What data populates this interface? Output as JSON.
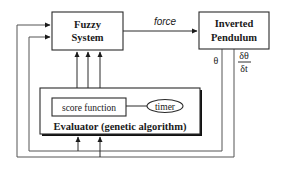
{
  "diagram": {
    "nodes": {
      "fuzzy_system": {
        "line1": "Fuzzy",
        "line2": "System"
      },
      "inverted_pendulum": {
        "line1": "Inverted",
        "line2": "Pendulum"
      },
      "evaluator": {
        "label": "Evaluator (genetic algorithm)"
      },
      "score_function": {
        "label": "score function"
      },
      "timer": {
        "label": "timer"
      }
    },
    "edges": {
      "force": {
        "label": "force",
        "from": "fuzzy_system",
        "to": "inverted_pendulum"
      },
      "theta": {
        "label": "θ",
        "from": "inverted_pendulum",
        "to": [
          "fuzzy_system",
          "evaluator"
        ]
      },
      "dtheta_dt": {
        "numerator": "δθ",
        "denominator": "δt",
        "from": "inverted_pendulum",
        "to": [
          "fuzzy_system",
          "evaluator"
        ]
      },
      "evaluator_to_fuzzy": {
        "count": 3,
        "from": "evaluator",
        "to": "fuzzy_system"
      },
      "score_to_timer": {
        "from": "score_function",
        "to": "timer"
      }
    },
    "colors": {
      "stroke": "#2a2a2a",
      "text": "#1a1a1a",
      "background": "#ffffff",
      "shadow": "#111111"
    }
  }
}
